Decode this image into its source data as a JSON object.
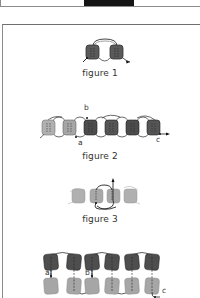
{
  "top_photo": {
    "name": "cropped-photo-strip"
  },
  "figures": [
    {
      "id": "figure-1",
      "caption": "figure 1",
      "labels": []
    },
    {
      "id": "figure-2",
      "caption": "figure 2",
      "labels": [
        "a",
        "b",
        "c"
      ]
    },
    {
      "id": "figure-3",
      "caption": "figure 3",
      "labels": []
    },
    {
      "id": "figure-4",
      "caption": "",
      "labels": [
        "a",
        "b",
        "c"
      ]
    }
  ],
  "colors": {
    "dark_bead": "#4a4a4a",
    "mid_bead": "#6a6a6a",
    "light_bead": "#a8a8a8",
    "thread": "#333333",
    "border": "#8a8a8a"
  }
}
